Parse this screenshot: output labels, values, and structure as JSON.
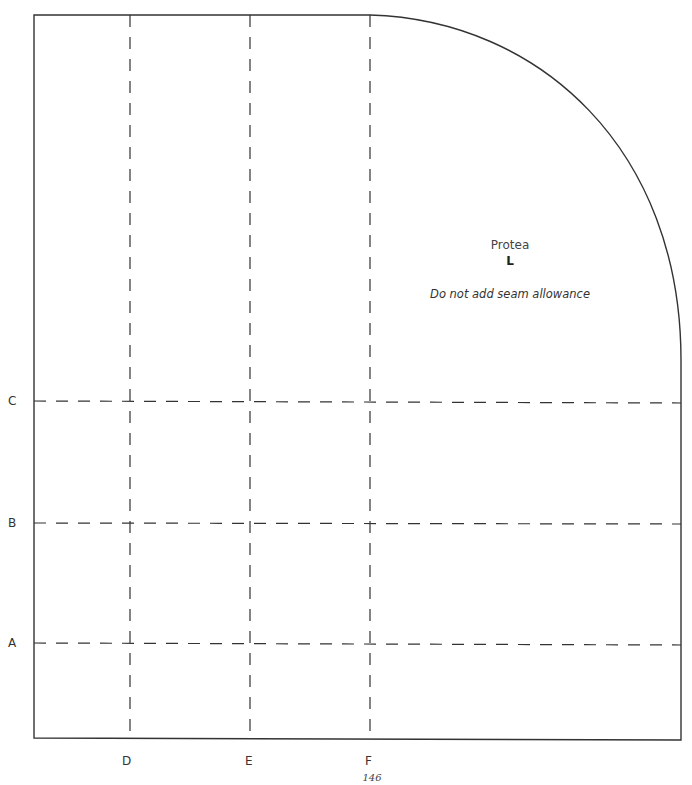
{
  "pattern": {
    "name": "Protea",
    "size": "L",
    "note": "Do not add seam allowance",
    "page_number": "146"
  },
  "lines": {
    "horizontal": [
      {
        "label": "C",
        "y": 401
      },
      {
        "label": "B",
        "y": 523
      },
      {
        "label": "A",
        "y": 643
      }
    ],
    "vertical": [
      {
        "label": "D",
        "x": 130
      },
      {
        "label": "E",
        "x": 250
      },
      {
        "label": "F",
        "x": 370
      }
    ]
  },
  "colors": {
    "outline": "#333333",
    "dash": "#333333",
    "background": "#ffffff"
  }
}
